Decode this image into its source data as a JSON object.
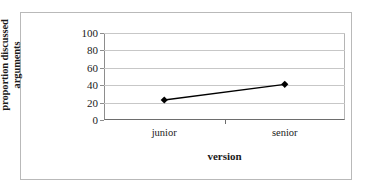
{
  "chart_data": {
    "type": "line",
    "title": "",
    "xlabel": "version",
    "ylabel": "proportion discussed arguments",
    "categories": [
      "junior",
      "senior"
    ],
    "values": [
      23,
      41
    ],
    "series": [
      {
        "name": "proportion discussed arguments",
        "values": [
          23,
          41
        ]
      }
    ],
    "ylim": [
      0,
      100
    ],
    "yticks": [
      0,
      20,
      40,
      60,
      80,
      100
    ],
    "ytick_labels": [
      "0",
      "20",
      "40",
      "60",
      "80",
      "100"
    ],
    "grid": "horizontal",
    "legend": "none",
    "marker": "diamond",
    "line_color": "#000000",
    "marker_color": "#000000",
    "gridline_color": "#c7c7c7",
    "axis_color": "#6d6d6d",
    "background": "#ffffff",
    "border_color": "#b9b9b9"
  }
}
